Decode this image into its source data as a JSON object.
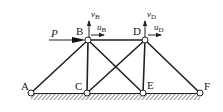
{
  "diagram": {
    "type": "truss",
    "nodes": [
      {
        "id": "A",
        "label": "A",
        "x": 31,
        "y": 93
      },
      {
        "id": "B",
        "label": "B",
        "x": 88,
        "y": 40
      },
      {
        "id": "C",
        "label": "C",
        "x": 87,
        "y": 93
      },
      {
        "id": "D",
        "label": "D",
        "x": 145,
        "y": 40
      },
      {
        "id": "E",
        "label": "E",
        "x": 143,
        "y": 93
      },
      {
        "id": "F",
        "label": "F",
        "x": 200,
        "y": 93
      }
    ],
    "members": [
      [
        "A",
        "B"
      ],
      [
        "B",
        "C"
      ],
      [
        "B",
        "E"
      ],
      [
        "B",
        "D"
      ],
      [
        "C",
        "D"
      ],
      [
        "D",
        "E"
      ],
      [
        "D",
        "F"
      ]
    ],
    "ground": {
      "from": "A",
      "to": "F"
    },
    "load": {
      "label": "P",
      "at": "B",
      "direction": "right"
    },
    "displacements": [
      {
        "node": "B",
        "vertical": {
          "var": "v",
          "sub": "B"
        },
        "horizontal": {
          "var": "u",
          "sub": "B"
        }
      },
      {
        "node": "D",
        "vertical": {
          "var": "v",
          "sub": "D"
        },
        "horizontal": {
          "var": "u",
          "sub": "D"
        }
      }
    ]
  },
  "labels": {
    "A": "A",
    "B": "B",
    "C": "C",
    "D": "D",
    "E": "E",
    "F": "F",
    "P": "P",
    "vB_var": "v",
    "vB_sub": "B",
    "uB_var": "u",
    "uB_sub": "B",
    "vD_var": "v",
    "vD_sub": "D",
    "uD_var": "u",
    "uD_sub": "D"
  },
  "colors": {
    "line": "#222222",
    "hatch": "#555555",
    "background": "#ffffff"
  }
}
